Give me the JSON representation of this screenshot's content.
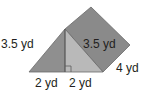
{
  "figure": {
    "type": "triangular-prism",
    "colors": {
      "back_face": "#8a8a8a",
      "triangle_left": "#8f8f8f",
      "triangle_right": "#b9b9b9",
      "edge": "#5a5a5a",
      "text": "#231f20",
      "background": "#ffffff"
    },
    "labels": {
      "left_slant": "3.5 yd",
      "right_slant": "3.5 yd",
      "depth": "4 yd",
      "base_left": "2 yd",
      "base_right": "2 yd"
    },
    "right_angle_marker": true
  }
}
